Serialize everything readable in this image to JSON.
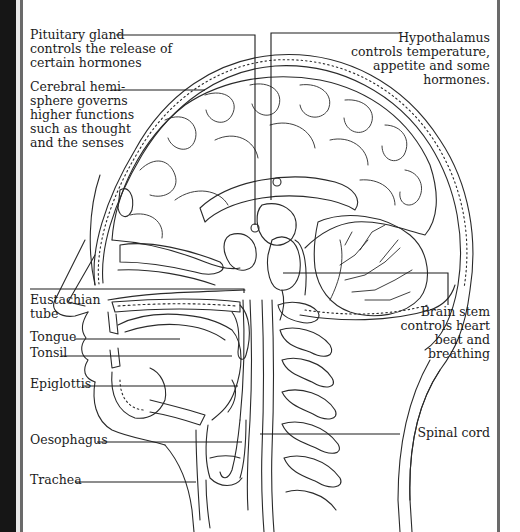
{
  "diagram": {
    "labels": {
      "pituitary": "Pituitary gland\ncontrols the release of\ncertain hormones",
      "cerebral": "Cerebral hemi-\nsphere governs\nhigher functions\nsuch as thought\nand the senses",
      "hypothalamus": "Hypothalamus\ncontrols temperature,\nappetite and some\nhormones.",
      "eustachian": "Eustachian\ntube",
      "tongue": "Tongue",
      "tonsil": "Tonsil",
      "epiglottis": "Epiglottis",
      "oesophagus": "Oesophagus",
      "trachea": "Trachea",
      "brainstem": "Brain stem\ncontrols heart\nbeat and\nbreathing",
      "spinalcord": "Spinal cord"
    },
    "colors": {
      "ink": "#1c1c1c",
      "frame_dark": "#161616",
      "frame_line": "#6a6a6a",
      "background": "#ffffff"
    }
  }
}
